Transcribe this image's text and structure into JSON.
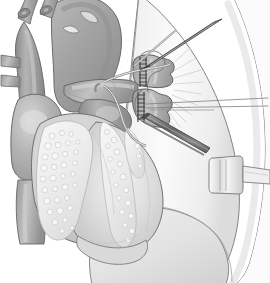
{
  "figure": {
    "title": "Intrapericardial dissection of pulmonary vessels and bronchus",
    "modality": "line-and-tone medical illustration",
    "palette": {
      "background": "#ffffff",
      "outline": "#4a4a4a",
      "outline_soft": "#8d8d8d",
      "vessel_dark": "#8e8e8e",
      "vessel_mid": "#a2a2a2",
      "vessel_light": "#b8b8b8",
      "heart_mid": "#bdbdbd",
      "heart_light": "#d4d4d4",
      "epicardial_fat": "#ececec",
      "fat_globule": "#f6f6f6",
      "lung_light": "#f4f4f4",
      "lung_shade": "#e2e2e2",
      "instrument_dark": "#6f6f6f",
      "instrument_mid": "#9c9c9c",
      "instrument_light": "#d8d8d8",
      "suture_line": "#3f3f3f"
    },
    "view": {
      "width": 270,
      "height": 283,
      "orientation": "left anterolateral thoracic view"
    }
  },
  "anatomy": {
    "heart": {
      "label": "heart",
      "description": "anterior cardiac silhouette occupying the left two thirds of the field",
      "parts": [
        {
          "name": "aortic-arch",
          "label": "aortic arch"
        },
        {
          "name": "brachiocephalic-trunk",
          "label": "brachiocephalic trunk"
        },
        {
          "name": "left-common-carotid-artery",
          "label": "left common carotid artery"
        },
        {
          "name": "superior-vena-cava",
          "label": "superior vena cava"
        },
        {
          "name": "azygos-branch-upper",
          "label": "upper venous branch"
        },
        {
          "name": "azygos-branch-lower",
          "label": "lower venous branch"
        },
        {
          "name": "right-atrial-appendage",
          "label": "right atrial appendage"
        },
        {
          "name": "pulmonary-trunk",
          "label": "pulmonary trunk"
        },
        {
          "name": "right-ventricle",
          "label": "right ventricle"
        },
        {
          "name": "left-ventricle",
          "label": "left ventricle"
        },
        {
          "name": "cardiac-apex",
          "label": "cardiac apex"
        },
        {
          "name": "inferior-vena-cava",
          "label": "inferior vena cava"
        },
        {
          "name": "epicardial-fat-pad",
          "label": "epicardial fat along the interventricular groove"
        }
      ]
    },
    "lung": {
      "label": "lung",
      "description": "pale lung filling the right side of the field behind the hilum",
      "parts": [
        {
          "name": "upper-lobe",
          "label": "upper lobe"
        },
        {
          "name": "lower-lobe",
          "label": "lower lobe"
        },
        {
          "name": "oblique-fissure",
          "label": "oblique fissure"
        },
        {
          "name": "lung-parenchyma-striae",
          "label": "radiating hilar striae"
        }
      ]
    },
    "hilum": {
      "label": "pulmonary hilum",
      "stumps": [
        {
          "name": "upper-stump",
          "label": "upper divided pulmonary vessel stump",
          "closure": "transverse staple / suture line",
          "suture_rungs": 8
        },
        {
          "name": "lower-stump",
          "label": "lower divided pulmonary vessel stump",
          "closure": "transverse staple / suture line",
          "suture_rungs": 7
        }
      ],
      "sutures": [
        {
          "name": "traction-suture-upper",
          "label": "traction suture loop, upper"
        },
        {
          "name": "traction-suture-lower",
          "label": "traction suture, lower"
        },
        {
          "name": "suture-tails-right",
          "label": "paired suture tails drawn laterally"
        }
      ]
    }
  },
  "instruments": [
    {
      "name": "upper-forceps",
      "label": "upper dissecting forceps",
      "entry": "from upper right, tip at the upper stump",
      "shade": "dark"
    },
    {
      "name": "lower-forceps",
      "label": "lower dissecting forceps",
      "entry": "from lower right, tip at the lower stump",
      "shade": "dark"
    },
    {
      "name": "right-angle-clamp",
      "label": "right-angle clamp encircling the hilar structures",
      "entry": "from the left, curving around the stumps",
      "shade": "light"
    },
    {
      "name": "lung-retractor",
      "label": "malleable lung retractor on the lateral lung margin",
      "entry": "from the right edge of the field",
      "shade": "light"
    }
  ],
  "annotations": {
    "labels_visible": false,
    "leader_lines_visible": false,
    "caption": ""
  }
}
